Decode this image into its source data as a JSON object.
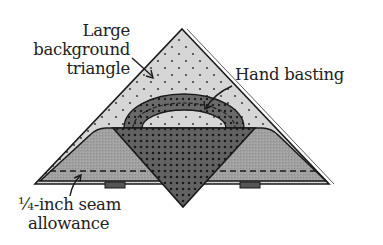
{
  "diagram": {
    "labels": {
      "background_triangle": [
        "Large",
        "background",
        "triangle"
      ],
      "hand_basting": "Hand basting",
      "seam_allowance": [
        "¼-inch seam",
        "allowance"
      ]
    },
    "colors": {
      "background_triangle_fill": "#d6d6d6",
      "side_piece_fill": "#9a9a9a",
      "center_piece_fill": "#5e5e5e",
      "arc_fill": "#6a6a6a",
      "outline": "#1a1a1a",
      "text": "#222222"
    }
  }
}
